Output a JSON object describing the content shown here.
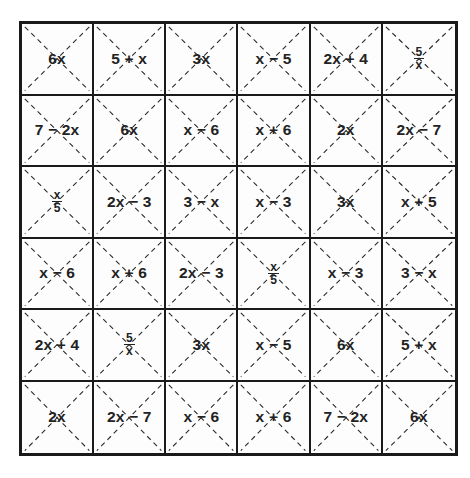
{
  "puzzle": {
    "rows": 6,
    "cols": 6,
    "cells": [
      [
        {
          "type": "text",
          "label": "6x"
        },
        {
          "type": "text",
          "label": "5 + x"
        },
        {
          "type": "text",
          "label": "3x"
        },
        {
          "type": "text",
          "label": "x − 5"
        },
        {
          "type": "text",
          "label": "2x + 4"
        },
        {
          "type": "fraction",
          "num": "5",
          "den": "x"
        }
      ],
      [
        {
          "type": "text",
          "label": "7 − 2x"
        },
        {
          "type": "text",
          "label": "6x"
        },
        {
          "type": "text",
          "label": "x − 6"
        },
        {
          "type": "text",
          "label": "x + 6"
        },
        {
          "type": "text",
          "label": "2x"
        },
        {
          "type": "text",
          "label": "2x − 7"
        }
      ],
      [
        {
          "type": "fraction",
          "num": "x",
          "den": "5"
        },
        {
          "type": "text",
          "label": "2x − 3"
        },
        {
          "type": "text",
          "label": "3 − x"
        },
        {
          "type": "text",
          "label": "x − 3"
        },
        {
          "type": "text",
          "label": "3x"
        },
        {
          "type": "text",
          "label": "x + 5"
        }
      ],
      [
        {
          "type": "text",
          "label": "x − 6"
        },
        {
          "type": "text",
          "label": "x + 6"
        },
        {
          "type": "text",
          "label": "2x − 3"
        },
        {
          "type": "fraction",
          "num": "x",
          "den": "5"
        },
        {
          "type": "text",
          "label": "x − 3"
        },
        {
          "type": "text",
          "label": "3 − x"
        }
      ],
      [
        {
          "type": "text",
          "label": "2x + 4"
        },
        {
          "type": "fraction",
          "num": "5",
          "den": "x"
        },
        {
          "type": "text",
          "label": "3x"
        },
        {
          "type": "text",
          "label": "x − 5"
        },
        {
          "type": "text",
          "label": "6x"
        },
        {
          "type": "text",
          "label": "5 + x"
        }
      ],
      [
        {
          "type": "text",
          "label": "2x"
        },
        {
          "type": "text",
          "label": "2x − 7"
        },
        {
          "type": "text",
          "label": "x − 6"
        },
        {
          "type": "text",
          "label": "x + 6"
        },
        {
          "type": "text",
          "label": "7 − 2x"
        },
        {
          "type": "text",
          "label": "6x"
        }
      ]
    ]
  },
  "colors": {
    "grid_line": "#1a1a1a",
    "diagonal_dash": "#2a2a2a",
    "text": "#222222",
    "background": "#ffffff"
  }
}
